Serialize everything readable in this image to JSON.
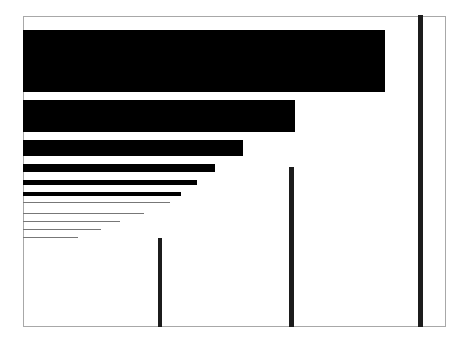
{
  "chart_data": {
    "type": "bar",
    "title": "",
    "xlabel": "",
    "ylabel": "",
    "grid": false,
    "legend": null,
    "series": [
      {
        "name": "horizontal_bars",
        "orientation": "horizontal",
        "values": [
          362,
          272,
          220,
          192,
          174,
          158,
          147,
          121,
          97,
          78,
          55
        ],
        "thickness": [
          62,
          32,
          16,
          8,
          5,
          4,
          1,
          1,
          1,
          1,
          1
        ],
        "top": [
          30,
          100,
          140,
          164,
          180,
          192,
          202,
          213,
          221,
          229,
          237
        ]
      },
      {
        "name": "vertical_bars",
        "orientation": "vertical",
        "positions_x": [
          158,
          289,
          418
        ],
        "values": [
          89,
          160,
          312
        ],
        "thickness": [
          4,
          5,
          5
        ]
      }
    ],
    "colors": {
      "bar": "#000000",
      "vbar": "#1c1c1c",
      "frame": "#a8a8a8",
      "background": "#ffffff"
    }
  }
}
